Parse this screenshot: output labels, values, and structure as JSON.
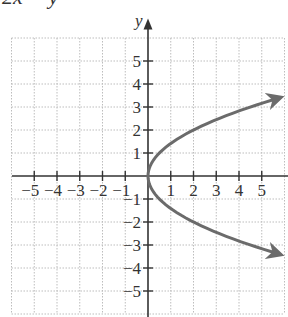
{
  "header": {
    "equation_partial": "2x = y²"
  },
  "chart_data": {
    "type": "line",
    "title": "",
    "equation": "x = y²/2",
    "xlabel": "",
    "ylabel": "y",
    "xlim": [
      -6,
      6
    ],
    "ylim": [
      -6,
      6
    ],
    "grid": true,
    "x_ticks": [
      -5,
      -4,
      -3,
      -2,
      -1,
      1,
      2,
      3,
      4,
      5
    ],
    "y_ticks": [
      -5,
      -4,
      -3,
      -2,
      -1,
      1,
      2,
      3,
      4,
      5
    ],
    "x_tick_labels": [
      "−5",
      "−4",
      "−3",
      "−2",
      "−1",
      "1",
      "2",
      "3",
      "4",
      "5"
    ],
    "y_tick_labels": [
      "−5",
      "−4",
      "−3",
      "−2",
      "−1",
      "1",
      "2",
      "3",
      "4",
      "5"
    ],
    "series": [
      {
        "name": "parabola",
        "color": "#6b6b6b",
        "arrows": "both-ends",
        "points": [
          {
            "x": 6,
            "y": 3.46
          },
          {
            "x": 4.5,
            "y": 3
          },
          {
            "x": 2,
            "y": 2
          },
          {
            "x": 1.125,
            "y": 1.5
          },
          {
            "x": 0.5,
            "y": 1
          },
          {
            "x": 0.125,
            "y": 0.5
          },
          {
            "x": 0,
            "y": 0
          },
          {
            "x": 0.125,
            "y": -0.5
          },
          {
            "x": 0.5,
            "y": -1
          },
          {
            "x": 1.125,
            "y": -1.5
          },
          {
            "x": 2,
            "y": -2
          },
          {
            "x": 4.5,
            "y": -3
          },
          {
            "x": 6,
            "y": -3.46
          }
        ]
      }
    ]
  },
  "colors": {
    "axis": "#333333",
    "grid": "#bdbdbd",
    "curve": "#6b6b6b"
  }
}
